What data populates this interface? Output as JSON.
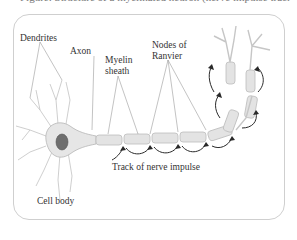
{
  "caption": "Figure: Structure of a myelinated neuron (nerve impulse track)",
  "labels": {
    "dendrites": "Dendrites",
    "axon": "Axon",
    "myelin_line1": "Myelin",
    "myelin_line2": "sheath",
    "nodes_line1": "Nodes of",
    "nodes_line2": "Ranvier",
    "track": "Track of nerve impulse",
    "cell_body": "Cell body"
  },
  "colors": {
    "frame": "#cfcfcf",
    "neuron_fill": "#e6e6e6",
    "neuron_stroke": "#b5b5b5",
    "nucleus": "#6e6e6e",
    "arrow": "#2a2a2a",
    "text": "#333333"
  }
}
